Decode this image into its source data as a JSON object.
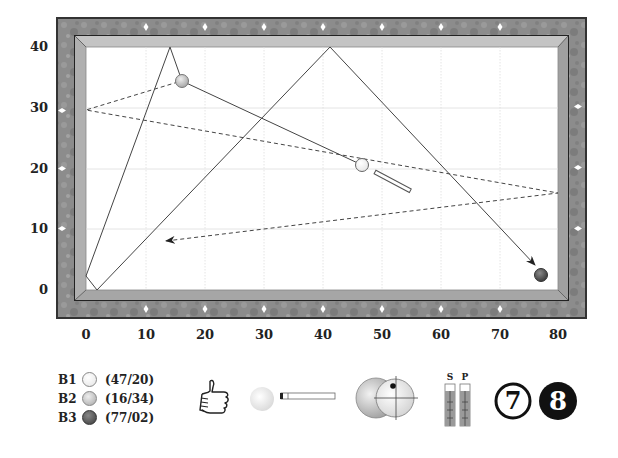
{
  "table": {
    "frame_color": "#8a8a8a",
    "cushion_color": "#b4b4b4",
    "cloth_color": "#ffffff",
    "grid_color": "#dcdcdc",
    "x_axis": {
      "ticks": [
        "0",
        "10",
        "20",
        "30",
        "40",
        "50",
        "60",
        "70",
        "80"
      ],
      "range": [
        0,
        80
      ]
    },
    "y_axis": {
      "ticks": [
        "40",
        "30",
        "20",
        "10",
        "0"
      ],
      "range": [
        0,
        40
      ]
    },
    "diamonds": {
      "top": 7,
      "bottom": 7,
      "left": 3,
      "right": 3
    }
  },
  "balls": [
    {
      "id": "B1",
      "label": "B1",
      "coord": "(47/20)",
      "x": 47,
      "y": 20,
      "color": "#ffffff",
      "role": "cue ball"
    },
    {
      "id": "B2",
      "label": "B2",
      "coord": "(16/34)",
      "x": 16,
      "y": 34,
      "color": "#c8c8c8",
      "role": "object ball"
    },
    {
      "id": "B3",
      "label": "B3",
      "coord": "(77/02)",
      "x": 77,
      "y": 2,
      "color": "#555555",
      "role": "object ball"
    }
  ],
  "paths": {
    "cue_ball_path": [
      [
        47,
        20
      ],
      [
        16,
        34
      ],
      [
        14,
        40
      ],
      [
        0,
        2.5
      ],
      [
        2,
        0
      ],
      [
        41,
        40
      ],
      [
        76,
        4
      ]
    ],
    "object_ball_path_dashed": [
      [
        16,
        34
      ],
      [
        0,
        29.5
      ],
      [
        80,
        16
      ],
      [
        14,
        8
      ]
    ]
  },
  "toolbar": {
    "thumbs_up": "thumbs-up",
    "cue_strike": "cue-and-ball",
    "ball_contact": "ball-hit-point",
    "sp_gauge": {
      "labels": [
        "S",
        "P"
      ]
    },
    "level_numbers": [
      "7",
      "8"
    ]
  }
}
